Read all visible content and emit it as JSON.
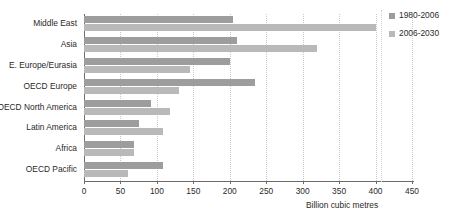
{
  "chart_data": {
    "type": "bar",
    "orientation": "horizontal",
    "title": "",
    "xlabel": "Billion cubic metres",
    "ylabel": "",
    "xlim": [
      0,
      450
    ],
    "xticks": [
      0,
      50,
      100,
      150,
      200,
      250,
      300,
      350,
      400,
      450
    ],
    "grid": true,
    "legend_position": "right",
    "categories": [
      "Middle East",
      "Asia",
      "E. Europe/Eurasia",
      "OECD Europe",
      "OECD North America",
      "Latin America",
      "Africa",
      "OECD Pacific"
    ],
    "series": [
      {
        "name": "1980-2006",
        "color": "#9d9d9d",
        "values": [
          205,
          210,
          200,
          235,
          92,
          75,
          69,
          108
        ]
      },
      {
        "name": "2006-2030",
        "color": "#b9b9b9",
        "values": [
          400,
          320,
          145,
          130,
          118,
          108,
          69,
          60
        ]
      }
    ]
  },
  "legend": {
    "items": [
      {
        "label": "1980-2006"
      },
      {
        "label": "2006-2030"
      }
    ]
  }
}
